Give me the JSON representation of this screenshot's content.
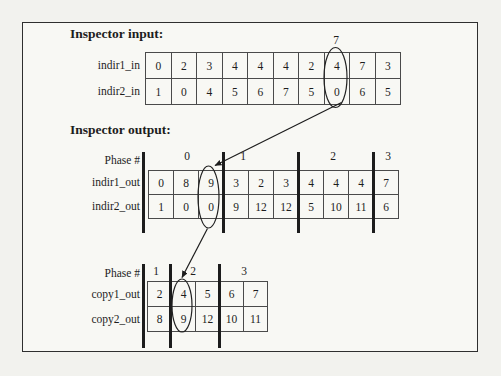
{
  "colors": {
    "ink": "#1d1d1d",
    "paper": "#f2f2ee",
    "grid_line": "#4a4a4a"
  },
  "headings": {
    "input": "Inspector input:",
    "output": "Inspector output:"
  },
  "input_table": {
    "pointer_label": "7",
    "rows": [
      {
        "label": "indir1_in",
        "values": [
          "0",
          "2",
          "3",
          "4",
          "4",
          "4",
          "2",
          "4",
          "7",
          "3"
        ]
      },
      {
        "label": "indir2_in",
        "values": [
          "1",
          "0",
          "4",
          "5",
          "6",
          "7",
          "5",
          "0",
          "6",
          "5"
        ]
      }
    ]
  },
  "output_table": {
    "phase_header": "Phase #",
    "phases": [
      "0",
      "1",
      "2",
      "3"
    ],
    "rows": [
      {
        "label": "indir1_out",
        "values": [
          "0",
          "8",
          "9",
          "3",
          "2",
          "3",
          "4",
          "4",
          "4",
          "7"
        ]
      },
      {
        "label": "indir2_out",
        "values": [
          "1",
          "0",
          "0",
          "9",
          "12",
          "12",
          "5",
          "10",
          "11",
          "6"
        ]
      }
    ]
  },
  "copy_table": {
    "phase_header": "Phase #",
    "phases": [
      "1",
      "2",
      "3"
    ],
    "rows": [
      {
        "label": "copy1_out",
        "values": [
          "2",
          "4",
          "5",
          "6",
          "7"
        ]
      },
      {
        "label": "copy2_out",
        "values": [
          "8",
          "9",
          "12",
          "10",
          "11"
        ]
      }
    ]
  }
}
